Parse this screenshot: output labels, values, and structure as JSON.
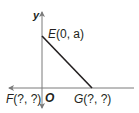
{
  "diagram": {
    "axes": {
      "x_label": "",
      "y_label": "y",
      "origin_label": "O"
    },
    "points": {
      "E": {
        "name": "E",
        "coords": "(0, a)"
      },
      "F": {
        "name": "F",
        "coords": "(?, ?)"
      },
      "G": {
        "name": "G",
        "coords": "(?, ?)"
      }
    },
    "colors": {
      "axis": "#7a7a7a",
      "segment": "#231f20",
      "text": "#231f20"
    }
  }
}
